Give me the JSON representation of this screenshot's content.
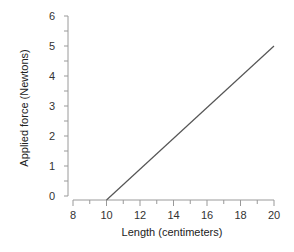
{
  "chart_data": {
    "type": "line",
    "title": "",
    "xlabel": "Length (centimeters)",
    "ylabel": "Applied force (Newtons)",
    "xlim": [
      8,
      20
    ],
    "ylim": [
      0,
      6
    ],
    "x_ticks": [
      8,
      10,
      12,
      14,
      16,
      18,
      20
    ],
    "x_minor_step": 1,
    "y_ticks": [
      0,
      1,
      2,
      3,
      4,
      5,
      6
    ],
    "y_minor_step": 0.5,
    "grid": false,
    "legend": null,
    "series": [
      {
        "name": "force-vs-length",
        "x": [
          10,
          20
        ],
        "y": [
          0,
          5
        ],
        "color": "#555555"
      }
    ]
  },
  "labels": {
    "x_ticks": [
      "8",
      "10",
      "12",
      "14",
      "16",
      "18",
      "20"
    ],
    "y_ticks": [
      "0",
      "1",
      "2",
      "3",
      "4",
      "5",
      "6"
    ],
    "xlabel": "Length (centimeters)",
    "ylabel": "Applied force (Newtons)"
  },
  "colors": {
    "axis": "#999999",
    "line": "#555555",
    "text": "#333333"
  }
}
